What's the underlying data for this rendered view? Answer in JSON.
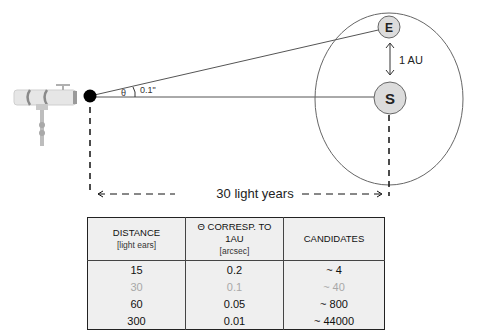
{
  "diagram": {
    "earth_label": "E",
    "sun_label": "S",
    "au_label": "1 AU",
    "theta_symbol": "θ",
    "angle_label": "0.1\"",
    "distance_label": "30 light years",
    "colors": {
      "body_fill": "#dcdcdc",
      "line": "#555555",
      "observer_dot": "#000000"
    }
  },
  "table": {
    "headers": [
      {
        "title": "DISTANCE",
        "unit": "[light ears]"
      },
      {
        "title": "Θ CORRESP. TO 1AU",
        "unit": "[arcsec]"
      },
      {
        "title": "CANDIDATES",
        "unit": ""
      }
    ],
    "rows": [
      {
        "distance": "15",
        "theta": "0.2",
        "candidates": "~ 4",
        "highlight": false
      },
      {
        "distance": "30",
        "theta": "0.1",
        "candidates": "~ 40",
        "highlight": true
      },
      {
        "distance": "60",
        "theta": "0.05",
        "candidates": "~ 800",
        "highlight": false
      },
      {
        "distance": "300",
        "theta": "0.01",
        "candidates": "~ 44000",
        "highlight": false
      }
    ]
  }
}
